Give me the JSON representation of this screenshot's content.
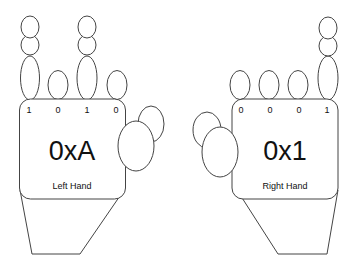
{
  "left_hand": {
    "bits": [
      "1",
      "0",
      "1",
      "0"
    ],
    "value": "0xA",
    "label": "Left Hand"
  },
  "right_hand": {
    "bits": [
      "0",
      "0",
      "0",
      "1"
    ],
    "value": "0x1",
    "label": "Right Hand"
  },
  "colors": {
    "stroke": "#444444",
    "text": "#111111",
    "background": "#ffffff"
  }
}
